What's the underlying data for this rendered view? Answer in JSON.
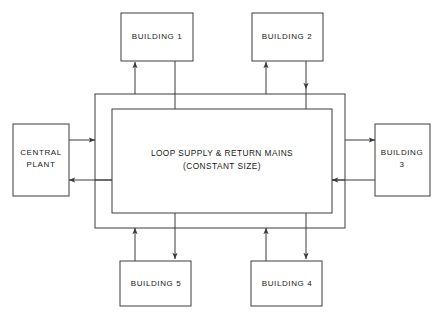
{
  "diagram": {
    "title_text": "",
    "colors": {
      "background": "#ffffff",
      "stroke": "#3c3c3c",
      "text": "#1a1a1a"
    },
    "central_label_line1": "LOOP SUPPLY & RETURN MAINS",
    "central_label_line2": "(CONSTANT SIZE)",
    "nodes": [
      {
        "id": "building-1",
        "label": "BUILDING 1"
      },
      {
        "id": "building-2",
        "label": "BUILDING 2"
      },
      {
        "id": "central-plant",
        "label_line1": "CENTRAL",
        "label_line2": "PLANT"
      },
      {
        "id": "building-3",
        "label_line1": "BUILDING",
        "label_line2": "3"
      },
      {
        "id": "building-4",
        "label": "BUILDING 4"
      },
      {
        "id": "building-5",
        "label": "BUILDING 5"
      }
    ]
  }
}
